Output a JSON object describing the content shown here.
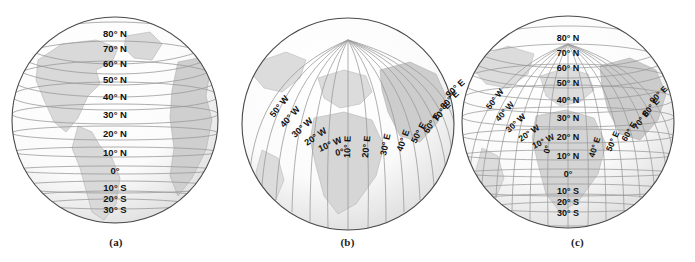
{
  "figure": {
    "background_color": "#ffffff",
    "ocean_color": "#fafafa",
    "land_color": "#d9d9d9",
    "grid_color": "#9a9a9a",
    "outline_color": "#4a4a4a",
    "label_color": "#111111"
  },
  "panels": [
    {
      "id": "a",
      "caption": "(a)",
      "kind": "parallels",
      "description": "Globe showing lines of latitude (parallels)",
      "latitude_labels": [
        "80° N",
        "70° N",
        "60° N",
        "50° N",
        "40° N",
        "30° N",
        "20° N",
        "10° N",
        "0°",
        "10° S",
        "20° S",
        "30° S"
      ],
      "longitude_labels": []
    },
    {
      "id": "b",
      "caption": "(b)",
      "kind": "meridians",
      "description": "Globe showing lines of longitude (meridians) converging at the pole",
      "latitude_labels": [],
      "longitude_labels": [
        "50° W",
        "40° W",
        "30° W",
        "20° W",
        "10° W",
        "0°",
        "10° E",
        "20° E",
        "30° E",
        "40° E",
        "50° E",
        "60° E",
        "70° E",
        "80° E",
        "90° E"
      ]
    },
    {
      "id": "c",
      "caption": "(c)",
      "kind": "graticule",
      "description": "Globe showing the full grid of latitude and longitude",
      "latitude_labels": [
        "80° N",
        "70° N",
        "60° N",
        "50° N",
        "40° N",
        "30° N",
        "20° N",
        "10° N",
        "0°",
        "10° S",
        "20° S",
        "30° S"
      ],
      "longitude_labels": [
        "50° W",
        "40° W",
        "30° W",
        "20° W",
        "10° W",
        "0°",
        "40° E",
        "50° E",
        "60° E",
        "70° E",
        "80° E",
        "90° E"
      ]
    }
  ],
  "geometry": {
    "a": {
      "cx": 115,
      "cy": 120,
      "r": 103,
      "label_x": 115
    },
    "b": {
      "cx": 348,
      "cy": 124,
      "r": 106,
      "pole_x": 348,
      "pole_y": 40
    },
    "c": {
      "cx": 568,
      "cy": 122,
      "r": 106,
      "label_x": 568,
      "pole_x": 568,
      "pole_y": 44
    }
  }
}
